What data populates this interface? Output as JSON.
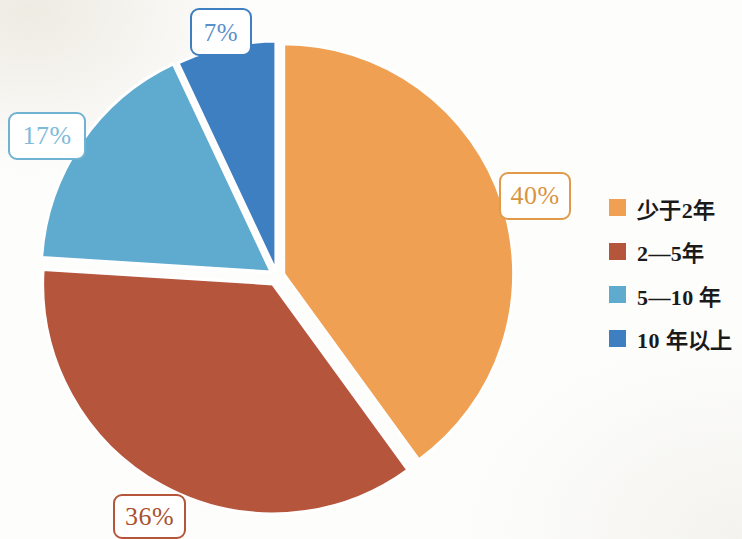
{
  "chart_data": {
    "type": "pie",
    "title": "",
    "subtitle": "",
    "xlabel": "",
    "ylabel": "",
    "legend_position": "right",
    "grid": false,
    "exploded": true,
    "start_angle_deg": 0,
    "direction": "clockwise",
    "categories": [
      "少于2年",
      "2—5年",
      "5—10 年",
      "10 年以上"
    ],
    "values": [
      40,
      36,
      17,
      7
    ],
    "value_unit": "%",
    "data_labels": [
      "40%",
      "36%",
      "17%",
      "7%"
    ],
    "colors": [
      "#F0A052",
      "#B5553C",
      "#5FAACF",
      "#3E7FC1"
    ],
    "slices": [
      {
        "label": "少于2年",
        "value": 40,
        "data_label": "40%",
        "color": "#F0A052",
        "start_deg": 0,
        "end_deg": 144
      },
      {
        "label": "2—5年",
        "value": 36,
        "data_label": "36%",
        "color": "#B5553C",
        "start_deg": 144,
        "end_deg": 273.6
      },
      {
        "label": "5—10 年",
        "value": 17,
        "data_label": "17%",
        "color": "#5FAACF",
        "start_deg": 273.6,
        "end_deg": 334.8
      },
      {
        "label": "10 年以上",
        "value": 7,
        "data_label": "7%",
        "color": "#3E7FC1",
        "start_deg": 334.8,
        "end_deg": 360
      }
    ]
  },
  "chart": {
    "labels": [
      {
        "text": "40%",
        "color": "#E09A4A",
        "text_color": "#D9933F"
      },
      {
        "text": "36%",
        "color": "#B5553C",
        "text_color": "#A8512F"
      },
      {
        "text": "17%",
        "color": "#6FB2D2",
        "text_color": "#7FBBD8"
      },
      {
        "text": "7%",
        "color": "#3E7FC1",
        "text_color": "#5B8FC9"
      }
    ]
  },
  "legend": {
    "items": [
      {
        "label": "少于2年",
        "color": "#F0A052"
      },
      {
        "label": "2—5年",
        "color": "#B5553C"
      },
      {
        "label": "5—10 年",
        "color": "#5FAACF"
      },
      {
        "label": "10 年以上",
        "color": "#3E7FC1"
      }
    ]
  }
}
